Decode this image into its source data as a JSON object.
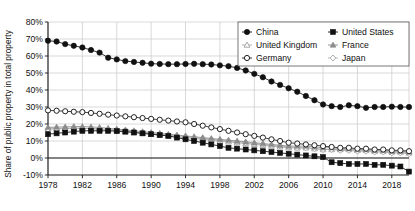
{
  "chart_data": {
    "type": "line",
    "title": "",
    "xlabel": "",
    "ylabel": "Share of public property in total property",
    "xlim": [
      1978,
      2020
    ],
    "ylim": [
      -10,
      80
    ],
    "ytick_labels": [
      "80%",
      "70%",
      "60%",
      "50%",
      "40%",
      "30%",
      "20%",
      "10%",
      "0%",
      "-10%"
    ],
    "ytick_values": [
      80,
      70,
      60,
      50,
      40,
      30,
      20,
      10,
      0,
      -10
    ],
    "xtick_labels": [
      "1978",
      "1982",
      "1986",
      "1990",
      "1994",
      "1998",
      "2002",
      "2006",
      "2010",
      "2014",
      "2018"
    ],
    "xtick_values": [
      1978,
      1982,
      1986,
      1990,
      1994,
      1998,
      2002,
      2006,
      2010,
      2014,
      2018
    ],
    "grid": true,
    "legend_position": "upper-right",
    "x": [
      1978,
      1979,
      1980,
      1981,
      1982,
      1983,
      1984,
      1985,
      1986,
      1987,
      1988,
      1989,
      1990,
      1991,
      1992,
      1993,
      1994,
      1995,
      1996,
      1997,
      1998,
      1999,
      2000,
      2001,
      2002,
      2003,
      2004,
      2005,
      2006,
      2007,
      2008,
      2009,
      2010,
      2011,
      2012,
      2013,
      2014,
      2015,
      2016,
      2017,
      2018,
      2019,
      2020
    ],
    "series": [
      {
        "name": "China",
        "marker": "filled-circle",
        "color": "#111111",
        "values": [
          69,
          68.5,
          67,
          66,
          65,
          63.5,
          62,
          59,
          58,
          57,
          56.5,
          56,
          55.5,
          55.3,
          55.2,
          55.2,
          55.3,
          55.4,
          55.2,
          55,
          54.5,
          54,
          53,
          51.5,
          49.5,
          47.5,
          45,
          43,
          41,
          39,
          36.5,
          34,
          31.5,
          30.5,
          30,
          31,
          30.5,
          29.5,
          30,
          30,
          30.2,
          30,
          30
        ]
      },
      {
        "name": "United States",
        "marker": "filled-square",
        "color": "#111111",
        "values": [
          14,
          14.5,
          15,
          15.5,
          16,
          16,
          16,
          16,
          15.8,
          15.5,
          15,
          14.5,
          14,
          13.5,
          13,
          12,
          11,
          10,
          9,
          8,
          7,
          6,
          5.5,
          5,
          4.5,
          4,
          3.5,
          3,
          2.5,
          2,
          1.5,
          1,
          0.5,
          -2.5,
          -3,
          -3.5,
          -3.5,
          -3.5,
          -4,
          -4,
          -4.5,
          -5,
          -8
        ]
      },
      {
        "name": "United Kingdom",
        "marker": "open-triangle-light",
        "color": "#a8a8a8",
        "values": [
          17.5,
          17.5,
          17.5,
          17.5,
          17.5,
          17.3,
          17,
          16.5,
          16,
          15.5,
          15,
          14.5,
          14,
          13.5,
          13,
          12.5,
          12,
          11.5,
          11,
          10.5,
          10,
          9.5,
          9,
          8.5,
          8,
          7.5,
          7,
          6.5,
          6,
          6,
          6,
          5.5,
          5,
          5,
          5,
          5,
          4.5,
          4.5,
          4,
          4,
          3.5,
          3.5,
          3
        ]
      },
      {
        "name": "France",
        "marker": "filled-triangle-light",
        "color": "#8c8c8c",
        "values": [
          18,
          18.2,
          18.3,
          18.5,
          18.5,
          18.3,
          18,
          17.5,
          17,
          16.5,
          16,
          15.5,
          15,
          14.5,
          14,
          13.5,
          13,
          12.5,
          12,
          11.5,
          11,
          10.5,
          10,
          9.5,
          9,
          8.5,
          8,
          7.5,
          7,
          7,
          7,
          6.5,
          6,
          6,
          5.5,
          5.5,
          5,
          5,
          4.5,
          4.5,
          4,
          4,
          3.5
        ]
      },
      {
        "name": "Germany",
        "marker": "open-circle",
        "color": "#222222",
        "values": [
          28,
          27.8,
          27.5,
          27.2,
          27,
          26.5,
          26,
          25.5,
          25,
          24.5,
          24,
          23.5,
          23,
          22.5,
          22,
          21.5,
          21,
          20,
          19,
          18,
          17,
          16,
          15,
          14,
          13,
          12,
          11,
          10,
          9,
          8.5,
          8,
          7.5,
          7,
          6.5,
          6,
          6,
          5.5,
          5.5,
          5,
          5,
          4.5,
          4.5,
          4
        ]
      },
      {
        "name": "Japan",
        "marker": "open-diamond-light",
        "color": "#b0b0b0",
        "values": [
          17,
          17.2,
          17.3,
          17.5,
          17.5,
          17.3,
          17,
          16.8,
          16.5,
          16,
          15.5,
          15,
          14.5,
          14,
          13.5,
          13,
          12.5,
          12,
          11.5,
          11,
          10.5,
          10,
          9.5,
          9,
          8.5,
          8,
          7.5,
          7,
          6.5,
          6,
          6,
          5.5,
          5,
          5,
          4.5,
          4.5,
          4,
          4,
          3.5,
          3.5,
          3,
          3,
          2.5
        ]
      }
    ],
    "legend": [
      {
        "label": "China",
        "marker": "filled-circle",
        "color": "#111111"
      },
      {
        "label": "United States",
        "marker": "filled-square",
        "color": "#111111"
      },
      {
        "label": "United Kingdom",
        "marker": "open-triangle-light",
        "color": "#a8a8a8"
      },
      {
        "label": "France",
        "marker": "filled-triangle-light",
        "color": "#8c8c8c"
      },
      {
        "label": "Germany",
        "marker": "open-circle",
        "color": "#222222"
      },
      {
        "label": "Japan",
        "marker": "open-diamond-light",
        "color": "#b0b0b0"
      }
    ]
  }
}
